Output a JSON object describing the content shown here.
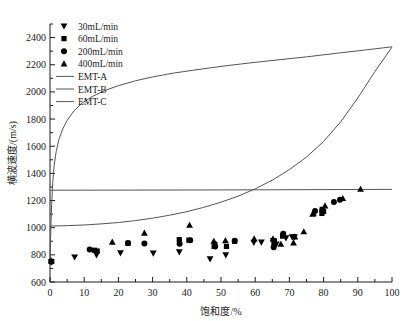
{
  "chart_data": {
    "type": "scatter",
    "title": "",
    "xlabel": "饱和度/%",
    "ylabel": "横波速度/(m/s)",
    "xlim": [
      0,
      100
    ],
    "ylim": [
      600,
      2500
    ],
    "xticks": [
      0,
      10,
      20,
      30,
      40,
      50,
      60,
      70,
      80,
      90,
      100
    ],
    "yticks": [
      600,
      800,
      1000,
      1200,
      1400,
      1600,
      1800,
      2000,
      2200,
      2400
    ],
    "xtick_labels": [
      "0",
      "10",
      "20",
      "30",
      "40",
      "50",
      "60",
      "70",
      "80",
      "90",
      "100"
    ],
    "ytick_labels": [
      "600",
      "800",
      "1000",
      "1200",
      "1400",
      "1600",
      "1800",
      "2000",
      "2200",
      "2400"
    ],
    "grid": false,
    "minor_ticks": true,
    "legend_position": "top-left",
    "legend": [
      {
        "label": "30mL/min",
        "marker": "triangle-down",
        "kind": "scatter"
      },
      {
        "label": "60mL/min",
        "marker": "square",
        "kind": "scatter"
      },
      {
        "label": "200mL/min",
        "marker": "circle",
        "kind": "scatter"
      },
      {
        "label": "400mL/min",
        "marker": "triangle-up",
        "kind": "scatter"
      },
      {
        "label": "EMT-A",
        "marker": "line",
        "kind": "line"
      },
      {
        "label": "EMT-B",
        "marker": "line",
        "kind": "line"
      },
      {
        "label": "EMT-C",
        "marker": "line",
        "kind": "line"
      }
    ],
    "series": [
      {
        "name": "30mL/min",
        "marker": "triangle-down",
        "color": "#000000",
        "points": [
          [
            0.4,
            748
          ],
          [
            7.2,
            784
          ],
          [
            13.6,
            800
          ],
          [
            20.6,
            814
          ],
          [
            30.2,
            812
          ],
          [
            37.8,
            822
          ],
          [
            46.8,
            770
          ],
          [
            51.4,
            800
          ],
          [
            59.6,
            892
          ],
          [
            61.8,
            894
          ],
          [
            65.3,
            905
          ],
          [
            66.2,
            880
          ],
          [
            69.0,
            925
          ],
          [
            70.8,
            933
          ],
          [
            71.5,
            932
          ]
        ]
      },
      {
        "name": "60mL/min",
        "marker": "square",
        "color": "#000000",
        "points": [
          [
            0.4,
            752
          ],
          [
            13.0,
            834
          ],
          [
            13.8,
            828
          ],
          [
            22.8,
            884
          ],
          [
            37.8,
            912
          ],
          [
            40.6,
            908
          ],
          [
            48.0,
            862
          ],
          [
            48.2,
            878
          ],
          [
            51.6,
            862
          ],
          [
            54.0,
            900
          ],
          [
            65.5,
            884
          ],
          [
            65.6,
            900
          ],
          [
            68.0,
            938
          ],
          [
            79.5,
            1105
          ],
          [
            79.6,
            1135
          ],
          [
            80.0,
            1120
          ]
        ]
      },
      {
        "name": "200mL/min",
        "marker": "circle",
        "color": "#000000",
        "points": [
          [
            0.4,
            750
          ],
          [
            11.6,
            840
          ],
          [
            22.8,
            888
          ],
          [
            27.6,
            884
          ],
          [
            37.9,
            882
          ],
          [
            41.0,
            908
          ],
          [
            48.3,
            862
          ],
          [
            54.0,
            903
          ],
          [
            65.4,
            856
          ],
          [
            68.2,
            955
          ],
          [
            77.5,
            1122
          ],
          [
            79.6,
            1128
          ],
          [
            83.0,
            1190
          ],
          [
            84.8,
            1205
          ]
        ]
      },
      {
        "name": "400mL/min",
        "marker": "triangle-up",
        "color": "#000000",
        "points": [
          [
            0.4,
            756
          ],
          [
            18.2,
            894
          ],
          [
            27.6,
            960
          ],
          [
            40.8,
            1018
          ],
          [
            47.9,
            900
          ],
          [
            51.3,
            905
          ],
          [
            59.7,
            918
          ],
          [
            65.2,
            918
          ],
          [
            67.5,
            878
          ],
          [
            71.2,
            888
          ],
          [
            71.6,
            932
          ],
          [
            74.2,
            970
          ],
          [
            76.8,
            1100
          ],
          [
            77.0,
            1105
          ],
          [
            80.4,
            1160
          ],
          [
            85.6,
            1215
          ],
          [
            90.8,
            1283
          ]
        ]
      }
    ],
    "curves": [
      {
        "name": "EMT-A",
        "color": "#555555",
        "points": [
          [
            0.0,
            760
          ],
          [
            0.15,
            900
          ],
          [
            0.3,
            1040
          ],
          [
            0.5,
            1180
          ],
          [
            0.8,
            1330
          ],
          [
            1.2,
            1455
          ],
          [
            1.8,
            1560
          ],
          [
            2.6,
            1648
          ],
          [
            3.6,
            1720
          ],
          [
            5.0,
            1790
          ],
          [
            7.0,
            1860
          ],
          [
            9.5,
            1920
          ],
          [
            12.5,
            1968
          ],
          [
            16.0,
            2010
          ],
          [
            20.0,
            2046
          ],
          [
            25.0,
            2082
          ],
          [
            30.0,
            2110
          ],
          [
            36.0,
            2138
          ],
          [
            42.0,
            2160
          ],
          [
            50.0,
            2188
          ],
          [
            58.0,
            2212
          ],
          [
            66.0,
            2234
          ],
          [
            75.0,
            2258
          ],
          [
            85.0,
            2288
          ],
          [
            92.0,
            2308
          ],
          [
            100.0,
            2332
          ]
        ]
      },
      {
        "name": "EMT-B",
        "color": "#555555",
        "points": [
          [
            0.0,
            1276
          ],
          [
            50.0,
            1278
          ],
          [
            100.0,
            1282
          ]
        ]
      },
      {
        "name": "EMT-C",
        "color": "#555555",
        "points": [
          [
            0.0,
            1012
          ],
          [
            5.0,
            1015
          ],
          [
            10.0,
            1020
          ],
          [
            15.0,
            1028
          ],
          [
            20.0,
            1038
          ],
          [
            25.0,
            1052
          ],
          [
            30.0,
            1070
          ],
          [
            35.0,
            1092
          ],
          [
            40.0,
            1118
          ],
          [
            45.0,
            1150
          ],
          [
            50.0,
            1188
          ],
          [
            55.0,
            1232
          ],
          [
            60.0,
            1286
          ],
          [
            65.0,
            1350
          ],
          [
            70.0,
            1428
          ],
          [
            75.0,
            1520
          ],
          [
            80.0,
            1635
          ],
          [
            85.0,
            1780
          ],
          [
            90.0,
            1955
          ],
          [
            95.0,
            2150
          ],
          [
            100.0,
            2330
          ]
        ]
      }
    ]
  }
}
